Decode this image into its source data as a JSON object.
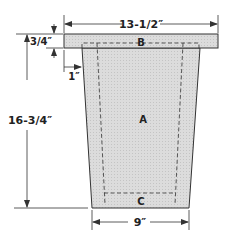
{
  "diagram": {
    "type": "woodworking-part-diagram",
    "parts": {
      "a": "A",
      "b": "B",
      "c": "C"
    },
    "dimensions": {
      "top_width": "13-1/2″",
      "top_thickness": "3/4″",
      "inset": "1″",
      "height": "16-3/4″",
      "bottom_width": "9″"
    },
    "colors": {
      "fill": "#d8d8d8",
      "line": "#333333",
      "background": "#ffffff"
    }
  }
}
